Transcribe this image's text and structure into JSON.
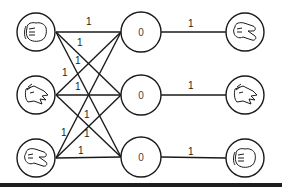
{
  "diagram": {
    "type": "network",
    "colors": {
      "stroke": "#1a1a1a",
      "background": "#ffffff",
      "bottom_bar": "#1e1e1e"
    },
    "left_nodes": [
      {
        "id": "L1",
        "icon": "rock-fist-icon",
        "label": "rock"
      },
      {
        "id": "L2",
        "icon": "paper-open-hand-icon",
        "label": "paper"
      },
      {
        "id": "L3",
        "icon": "scissors-hand-icon",
        "label": "scissors"
      }
    ],
    "middle_nodes": [
      {
        "id": "M1",
        "value": "0"
      },
      {
        "id": "M2",
        "value": "0"
      },
      {
        "id": "M3",
        "value": "0"
      }
    ],
    "right_nodes": [
      {
        "id": "R1",
        "icon": "scissors-hand-icon",
        "label": "scissors"
      },
      {
        "id": "R2",
        "icon": "paper-open-hand-icon",
        "label": "paper"
      },
      {
        "id": "R3",
        "icon": "rock-fist-icon",
        "label": "rock"
      }
    ],
    "left_edge_labels": [
      "1",
      "1",
      "1",
      "1",
      "1",
      "1",
      "1",
      "1",
      "1"
    ],
    "right_edges": [
      {
        "from": "M1",
        "to": "R1",
        "weight": "1"
      },
      {
        "from": "M2",
        "to": "R2",
        "weight": "1"
      },
      {
        "from": "M3",
        "to": "R3",
        "weight": "1"
      }
    ]
  }
}
